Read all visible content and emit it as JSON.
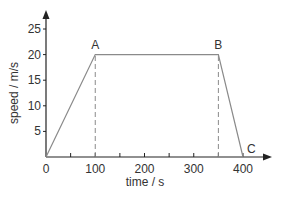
{
  "chart_data": {
    "type": "line",
    "title": "",
    "xlabel": "time / s",
    "ylabel": "speed / m/s",
    "xlim": [
      0,
      400
    ],
    "ylim": [
      0,
      25
    ],
    "grid": false,
    "x_ticks": [
      "0",
      "100",
      "200",
      "300",
      "400"
    ],
    "y_ticks": [
      "5",
      "10",
      "15",
      "20",
      "25"
    ],
    "series": [
      {
        "name": "speed",
        "x": [
          0,
          100,
          350,
          400
        ],
        "y": [
          0,
          20,
          20,
          0
        ]
      }
    ],
    "points": [
      {
        "label": "A",
        "x": 100,
        "y": 20
      },
      {
        "label": "B",
        "x": 350,
        "y": 20
      },
      {
        "label": "C",
        "x": 400,
        "y": 0
      }
    ],
    "annotations": [
      {
        "type": "dashed-vertical",
        "x": 100,
        "from_y": 0,
        "to_y": 20
      },
      {
        "type": "dashed-vertical",
        "x": 350,
        "from_y": 0,
        "to_y": 20
      }
    ]
  },
  "colors": {
    "axis": "#222222",
    "line": "#8a8a8a",
    "dashed": "#8a8a8a",
    "text": "#333333"
  }
}
